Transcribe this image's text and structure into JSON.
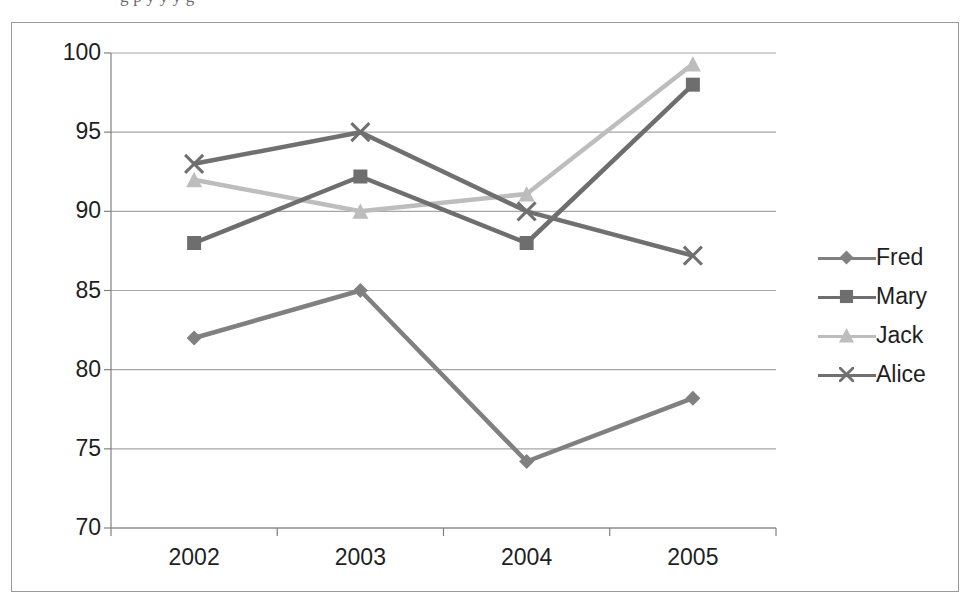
{
  "top_strip": {
    "ghost_text": "g p y y y g"
  },
  "chart_data": {
    "type": "line",
    "title": "",
    "subtitle": "",
    "xlabel": "",
    "ylabel": "",
    "categories": [
      "2002",
      "2003",
      "2004",
      "2005"
    ],
    "series": [
      {
        "name": "Fred",
        "marker": "diamond",
        "color": "#808080",
        "values": [
          82,
          85,
          74.2,
          78.2
        ]
      },
      {
        "name": "Mary",
        "marker": "square",
        "color": "#6e6e6e",
        "values": [
          88,
          92.2,
          88,
          98
        ]
      },
      {
        "name": "Jack",
        "marker": "triangle",
        "color": "#bdbdbd",
        "values": [
          92,
          90,
          91.1,
          99.3
        ]
      },
      {
        "name": "Alice",
        "marker": "x",
        "color": "#707070",
        "values": [
          93,
          95,
          90,
          87.2
        ]
      }
    ],
    "ylim": [
      70,
      100
    ],
    "yticks": [
      70,
      75,
      80,
      85,
      90,
      95,
      100
    ],
    "ytick_labels": [
      "70",
      "75",
      "80",
      "85",
      "90",
      "95",
      "100"
    ],
    "xtick_labels": [
      "2002",
      "2003",
      "2004",
      "2005"
    ],
    "grid": {
      "horizontal": true,
      "vertical": false,
      "color": "#a6a6a6"
    },
    "legend": {
      "position": "right",
      "entries": [
        "Fred",
        "Mary",
        "Jack",
        "Alice"
      ]
    },
    "plot_bg": "#ffffff",
    "border_color": "#9a9a9a",
    "axis_color": "#808080"
  }
}
